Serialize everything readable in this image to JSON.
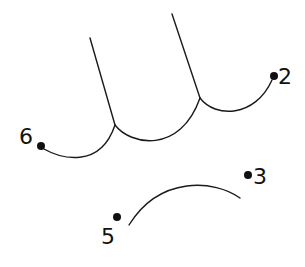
{
  "diagram": {
    "type": "connect-the-dots",
    "colors": {
      "line": "#1a1a1a",
      "dot": "#111111",
      "background": "#ffffff"
    },
    "points": [
      {
        "label": "6",
        "x": 41,
        "y": 146
      },
      {
        "label": "2",
        "x": 274,
        "y": 76
      },
      {
        "label": "3",
        "x": 248,
        "y": 175
      },
      {
        "label": "5",
        "x": 117,
        "y": 217
      }
    ],
    "labels": {
      "p6": "6",
      "p2": "2",
      "p3": "3",
      "p5": "5"
    }
  }
}
